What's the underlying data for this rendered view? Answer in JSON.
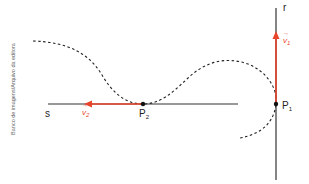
{
  "credit": "Banco de imagens/Arquivo da editora",
  "labels": {
    "line_s": "s",
    "line_r": "r",
    "point_1": "P",
    "point_1_sub": "1",
    "point_2": "P",
    "point_2_sub": "2",
    "vector_1": "v",
    "vector_1_sub": "1",
    "vector_2": "v",
    "vector_2_sub": "2"
  },
  "colors": {
    "vector": "#e8452b",
    "line": "#333333",
    "curve": "#222222"
  }
}
